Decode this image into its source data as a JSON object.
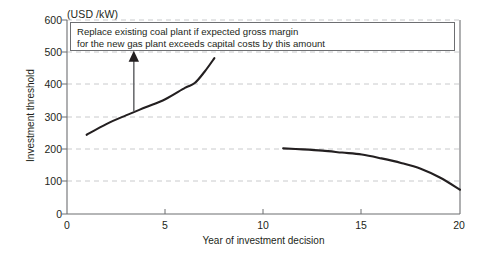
{
  "chart_data": {
    "type": "line",
    "title": "",
    "unit_label": "(USD /kW)",
    "xlabel": "Year of investment decision",
    "ylabel": "Investment threshold",
    "xlim": [
      0,
      20
    ],
    "ylim": [
      0,
      600
    ],
    "xticks": [
      0,
      5,
      10,
      15,
      20
    ],
    "yticks": [
      0,
      100,
      200,
      300,
      400,
      500,
      600
    ],
    "grid": "horizontal-dashed",
    "legend": "none",
    "series": [
      {
        "name": "rising-threshold",
        "x": [
          1.0,
          2.0,
          3.0,
          4.0,
          5.0,
          6.0,
          6.5,
          7.0,
          7.5
        ],
        "values": [
          245,
          278,
          305,
          330,
          355,
          390,
          405,
          440,
          482
        ]
      },
      {
        "name": "falling-threshold",
        "x": [
          11.0,
          12.0,
          13.0,
          14.0,
          15.0,
          16.0,
          17.0,
          18.0,
          19.0,
          20.0
        ],
        "values": [
          203,
          200,
          196,
          190,
          184,
          172,
          158,
          140,
          112,
          75
        ]
      }
    ],
    "annotations": [
      {
        "name": "callout-box",
        "lines": [
          "Replace existing coal plant if expected gross margin",
          "for the new gas plant exceeds capital costs by this amount"
        ]
      },
      {
        "name": "callout-arrow",
        "from_x": 3.4,
        "from_y": 318,
        "to_x": 3.4,
        "to_y": 505
      }
    ],
    "colors": {
      "line": "#231f20",
      "grid": "#c9cacc",
      "axis": "#6d6e71",
      "arrow": "#6d6e71",
      "text": "#231f20",
      "background": "#ffffff"
    }
  }
}
